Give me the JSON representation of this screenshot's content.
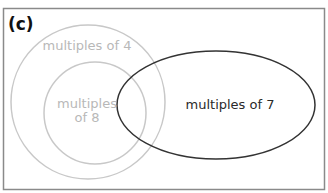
{
  "figure": {
    "label": "(c)",
    "sets": [
      {
        "name": "multiples of 4",
        "label_lines": [
          "multiples of 4"
        ],
        "color": "#c4c4c4"
      },
      {
        "name": "multiples of 8",
        "label_lines": [
          "multiples",
          "of 8"
        ],
        "color": "#c4c4c4"
      },
      {
        "name": "multiples of 7",
        "label_lines": [
          "multiples of 7"
        ],
        "color": "#333333"
      }
    ],
    "frame_color": "#8a8a8a"
  }
}
